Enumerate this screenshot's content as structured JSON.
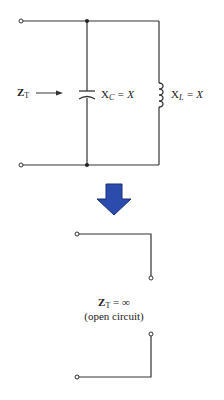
{
  "diagram": {
    "top_circuit": {
      "input_label": "Z",
      "input_label_sub": "T",
      "capacitor_label": "X",
      "capacitor_label_sub": "C",
      "capacitor_label_eq": "= X",
      "inductor_label": "X",
      "inductor_label_sub": "L",
      "inductor_label_eq": "= X"
    },
    "transition_arrow": {
      "color": "#2a4aa8",
      "direction": "down"
    },
    "bottom_circuit": {
      "result_label": "Z",
      "result_label_sub": "T",
      "result_label_eq": "= ∞",
      "caption": "(open circuit)"
    },
    "colors": {
      "wire": "#333333",
      "arrow_fill": "#2b4cad",
      "arrow_stroke": "#1a2f75"
    }
  }
}
